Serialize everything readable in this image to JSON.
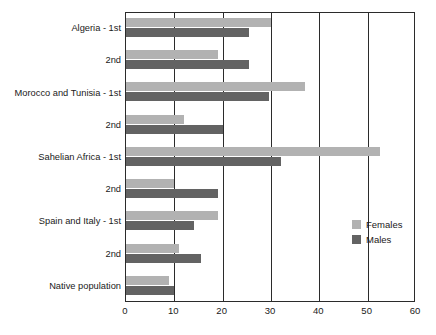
{
  "chart_data": {
    "type": "bar",
    "orientation": "horizontal",
    "title": "",
    "subtitle": "",
    "xlabel": "",
    "ylabel": "",
    "xlim": [
      0,
      60
    ],
    "ylim": [
      0,
      9
    ],
    "grid": true,
    "gridlines_x": [
      0,
      10,
      20,
      30,
      40,
      50,
      60
    ],
    "xticks": [
      0,
      10,
      20,
      30,
      40,
      50,
      60
    ],
    "xticklabels": [
      "0",
      "10",
      "20",
      "30",
      "40",
      "50",
      "60"
    ],
    "categories": [
      "Algeria - 1st",
      "2nd",
      "Morocco and Tunisia - 1st",
      "2nd",
      "Sahelian Africa - 1st",
      "2nd",
      "Spain and Italy - 1st",
      "2nd",
      "Native population"
    ],
    "series": [
      {
        "name": "Females",
        "color": "#b2b2b2",
        "values": [
          30.0,
          19.0,
          37.0,
          12.0,
          52.5,
          10.0,
          19.0,
          11.0,
          8.8
        ]
      },
      {
        "name": "Males",
        "color": "#636363",
        "values": [
          25.5,
          25.5,
          29.5,
          20.0,
          32.0,
          19.0,
          14.0,
          15.5,
          10.0
        ]
      }
    ],
    "legend": {
      "position": "inside-right",
      "entries": [
        {
          "label": "Females",
          "color": "#b2b2b2",
          "swatch": "legend-swatch-female"
        },
        {
          "label": "Males",
          "color": "#636363",
          "swatch": "legend-swatch-male"
        }
      ]
    },
    "axis_color": "#2b2b2b",
    "background": "#ffffff"
  }
}
